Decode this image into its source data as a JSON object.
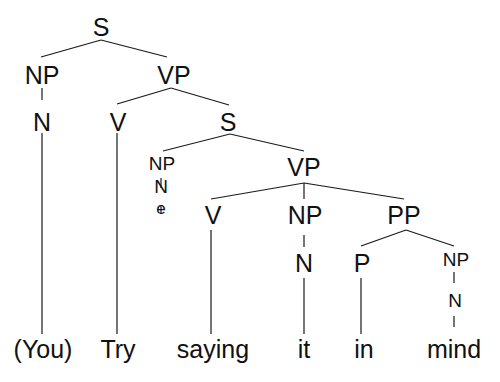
{
  "diagram": {
    "type": "syntax-tree",
    "sentence": "(You) Try saying it in mind",
    "nodes": {
      "root_s": "S",
      "np_subj": "NP",
      "n_subj": "N",
      "vp_main": "VP",
      "v_main": "V",
      "s_embedded": "S",
      "np_empty": "NP",
      "n_empty": "N",
      "e_empty": "e",
      "vp_embedded": "VP",
      "v_embedded": "V",
      "np_obj": "NP",
      "n_obj": "N",
      "pp": "PP",
      "p": "P",
      "np_pp": "NP",
      "n_pp": "N"
    },
    "leaves": [
      "(You)",
      "Try",
      "saying",
      "it",
      "in",
      "mind"
    ]
  }
}
